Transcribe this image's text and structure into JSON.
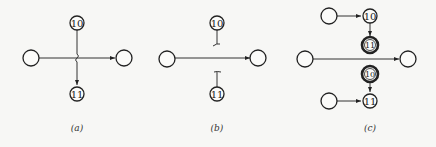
{
  "colors": {
    "stroke": "#222222",
    "background": "#f7f7f5"
  },
  "panels": [
    {
      "caption": "(a)",
      "nodes": [
        {
          "id": "left",
          "label": ""
        },
        {
          "id": "n10",
          "label": "10"
        },
        {
          "id": "n11",
          "label": "11"
        },
        {
          "id": "right",
          "label": ""
        }
      ],
      "edges": [
        {
          "from": "left",
          "to": "right",
          "style": "arrow"
        },
        {
          "from": "n10",
          "to": "n11",
          "style": "arrow-crossing-bridge"
        }
      ]
    },
    {
      "caption": "(b)",
      "nodes": [
        {
          "id": "left",
          "label": ""
        },
        {
          "id": "n10",
          "label": "10"
        },
        {
          "id": "n11",
          "label": "11"
        },
        {
          "id": "right",
          "label": ""
        }
      ],
      "edges": [
        {
          "from": "left",
          "to": "right",
          "style": "arrow"
        },
        {
          "from": "n10",
          "to": "n11",
          "style": "broken"
        }
      ]
    },
    {
      "caption": "(c)",
      "nodes": [
        {
          "id": "top-left",
          "label": ""
        },
        {
          "id": "n10a",
          "label": "10"
        },
        {
          "id": "n11a",
          "label": "11",
          "double": true
        },
        {
          "id": "left",
          "label": ""
        },
        {
          "id": "right",
          "label": ""
        },
        {
          "id": "n10b",
          "label": "10",
          "double": true
        },
        {
          "id": "bottom-left",
          "label": ""
        },
        {
          "id": "n11b",
          "label": "11"
        }
      ],
      "edges": [
        {
          "from": "top-left",
          "to": "n10a",
          "style": "arrow"
        },
        {
          "from": "n10a",
          "to": "n11a",
          "style": "arrow"
        },
        {
          "from": "left",
          "to": "right",
          "style": "arrow"
        },
        {
          "from": "n10b",
          "to": "n11b",
          "style": "arrow"
        },
        {
          "from": "bottom-left",
          "to": "n11b",
          "style": "arrow"
        }
      ]
    }
  ]
}
